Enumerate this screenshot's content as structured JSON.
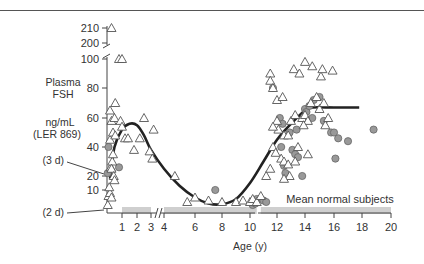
{
  "chart_data": {
    "type": "scatter",
    "title": "",
    "ylabel_lines": [
      "Plasma",
      "FSH",
      "",
      "ng/mL",
      "(LER 869)"
    ],
    "xlabel": "Age (y)",
    "y_ticks": [
      10,
      20,
      40,
      60,
      80,
      100,
      200,
      210
    ],
    "y_tick_labels": [
      "10",
      "20",
      "40",
      "60",
      "80",
      "100",
      "200",
      "210"
    ],
    "x_ticks": [
      1,
      2,
      3,
      4,
      6,
      8,
      10,
      12,
      14,
      16,
      18,
      20
    ],
    "x_tick_labels": [
      "1",
      "2",
      "3",
      "4",
      "6",
      "8",
      "10",
      "12",
      "14",
      "16",
      "18",
      "20"
    ],
    "axis_breaks": {
      "y": "between 100 and 200",
      "x": "between 3 and 4, and near 10.5"
    },
    "annotations": [
      {
        "text": "(3 d)",
        "x": 0.01,
        "y": 22
      },
      {
        "text": "(2 d)",
        "x": 0.0,
        "y": 0
      },
      {
        "text": "Mean normal subjects",
        "x": 14,
        "y": 8
      }
    ],
    "normal_band": {
      "label": "Mean normal subjects",
      "segments": [
        [
          1,
          3
        ],
        [
          4,
          10.5
        ],
        [
          10.8,
          20
        ]
      ],
      "y_range": [
        0,
        5
      ]
    },
    "series": [
      {
        "name": "triangles",
        "marker": "open-triangle",
        "points": [
          [
            0.05,
            0
          ],
          [
            0.1,
            6
          ],
          [
            0.2,
            8
          ],
          [
            0.3,
            5
          ],
          [
            0.15,
            12
          ],
          [
            0.25,
            26
          ],
          [
            0.35,
            30
          ],
          [
            0.3,
            25
          ],
          [
            0.45,
            20
          ],
          [
            0.5,
            17
          ],
          [
            0.4,
            35
          ],
          [
            0.2,
            45
          ],
          [
            0.4,
            50
          ],
          [
            0.55,
            48
          ],
          [
            0.3,
            58
          ],
          [
            0.5,
            60
          ],
          [
            0.2,
            65
          ],
          [
            0.55,
            70
          ],
          [
            0.8,
            100
          ],
          [
            1.0,
            100
          ],
          [
            0.3,
            210
          ],
          [
            0.9,
            58
          ],
          [
            1.0,
            54
          ],
          [
            1.2,
            46
          ],
          [
            1.4,
            46
          ],
          [
            1.8,
            38
          ],
          [
            2.2,
            46
          ],
          [
            2.5,
            60
          ],
          [
            2.9,
            37
          ],
          [
            3.1,
            32
          ],
          [
            3.2,
            52
          ],
          [
            4.7,
            20
          ],
          [
            6.0,
            5
          ],
          [
            5.5,
            2
          ],
          [
            7.0,
            3
          ],
          [
            8.0,
            2
          ],
          [
            9.0,
            2
          ],
          [
            9.5,
            3
          ],
          [
            10,
            2
          ],
          [
            10.2,
            4
          ],
          [
            10.5,
            2
          ],
          [
            10.8,
            6
          ],
          [
            11.2,
            20
          ],
          [
            11.5,
            25
          ],
          [
            11.7,
            40
          ],
          [
            11.9,
            36
          ],
          [
            12.0,
            58
          ],
          [
            12.1,
            52
          ],
          [
            12.3,
            32
          ],
          [
            12.5,
            30
          ],
          [
            12.8,
            28
          ],
          [
            12.5,
            48
          ],
          [
            12.9,
            20
          ],
          [
            13.0,
            58
          ],
          [
            13.3,
            62
          ],
          [
            13.5,
            40
          ],
          [
            13.8,
            60
          ],
          [
            14.0,
            62
          ],
          [
            14.2,
            58
          ],
          [
            14.4,
            70
          ],
          [
            14.8,
            74
          ],
          [
            15.0,
            66
          ],
          [
            15.1,
            88
          ],
          [
            15.3,
            70
          ],
          [
            15.4,
            55
          ],
          [
            15.6,
            60
          ],
          [
            11.5,
            90
          ],
          [
            11.5,
            85
          ],
          [
            11.7,
            80
          ],
          [
            13.2,
            93
          ],
          [
            13.6,
            90
          ],
          [
            15.2,
            93
          ],
          [
            15.9,
            92
          ],
          [
            12.0,
            72
          ],
          [
            12.4,
            74
          ],
          [
            14.0,
            98
          ],
          [
            14.5,
            95
          ],
          [
            13.9,
            55
          ],
          [
            14.2,
            35
          ],
          [
            13.3,
            30
          ],
          [
            12.5,
            18
          ],
          [
            11.7,
            54
          ],
          [
            12.8,
            48
          ]
        ]
      },
      {
        "name": "filled circles",
        "marker": "filled-circle",
        "points": [
          [
            0.05,
            22
          ],
          [
            0.1,
            40
          ],
          [
            0.8,
            26
          ],
          [
            7.5,
            10
          ],
          [
            10.2,
            0
          ],
          [
            10.4,
            1
          ],
          [
            10.5,
            4
          ],
          [
            11.0,
            3
          ],
          [
            11.2,
            2
          ],
          [
            11.7,
            80
          ],
          [
            12.2,
            60
          ],
          [
            12.3,
            40
          ],
          [
            12.5,
            27
          ],
          [
            12.6,
            22
          ],
          [
            13.1,
            38
          ],
          [
            13.3,
            35
          ],
          [
            13.5,
            33
          ],
          [
            13.8,
            20
          ],
          [
            14.0,
            66
          ],
          [
            14.1,
            64
          ],
          [
            14.3,
            68
          ],
          [
            14.6,
            72
          ],
          [
            15.0,
            74
          ],
          [
            14.5,
            60
          ],
          [
            15.3,
            58
          ],
          [
            15.8,
            50
          ],
          [
            16.3,
            46
          ],
          [
            17.0,
            44
          ],
          [
            18.8,
            52
          ],
          [
            16.0,
            50
          ],
          [
            16.1,
            32
          ],
          [
            12.4,
            56
          ],
          [
            12.9,
            50
          ],
          [
            13.4,
            52
          ]
        ]
      }
    ],
    "curve": {
      "name": "mean FSH curve",
      "points": [
        [
          0.2,
          18
        ],
        [
          0.5,
          40
        ],
        [
          1.0,
          52
        ],
        [
          1.5,
          56
        ],
        [
          2.0,
          55
        ],
        [
          2.5,
          48
        ],
        [
          3.0,
          38
        ],
        [
          4.0,
          25
        ],
        [
          5.0,
          13
        ],
        [
          6.0,
          5
        ],
        [
          7.0,
          1
        ],
        [
          8.0,
          0.5
        ],
        [
          9.0,
          4
        ],
        [
          10.0,
          15
        ],
        [
          11.0,
          30
        ],
        [
          12.0,
          45
        ],
        [
          13.0,
          56
        ],
        [
          14.0,
          65
        ],
        [
          14.5,
          67
        ],
        [
          16.0,
          67
        ],
        [
          17.8,
          67
        ]
      ]
    },
    "legend": "none",
    "grid": false
  }
}
